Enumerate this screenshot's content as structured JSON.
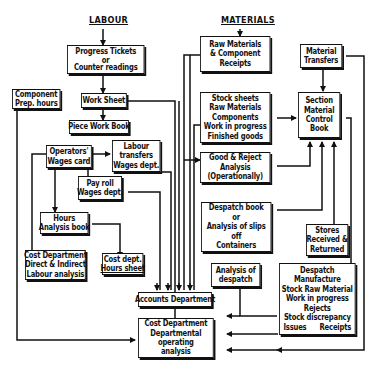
{
  "headings": {
    "labour": "LABOUR",
    "materials": "MATERIALS"
  },
  "boxes": {
    "progress_tickets": [
      "Progress Tickets",
      "or",
      "Counter readings"
    ],
    "component_prep": [
      "Component",
      "Prep. hours"
    ],
    "work_sheet": [
      "Work Sheet"
    ],
    "piece_work_book": [
      "Piece Work Book"
    ],
    "operators_wages": [
      "Operators'",
      "Wages card"
    ],
    "labour_transfers": [
      "Labour",
      "transfers",
      "Wages dept."
    ],
    "pay_roll": [
      "Pay roll",
      "Wages dept."
    ],
    "hours_analysis": [
      "Hours",
      "Analysis book"
    ],
    "cost_dept_labour": [
      "Cost Department",
      "Direct & Indirect",
      "Labour analysis"
    ],
    "cost_dept_hours": [
      "Cost dept.",
      "Hours sheet"
    ],
    "raw_materials": [
      "Raw Materials",
      "& Component",
      "Receipts"
    ],
    "material_transfers": [
      "Material",
      "Transfers"
    ],
    "stock_sheets": [
      "Stock sheets",
      "Raw Materials",
      "Components",
      "Work in progress",
      "Finished goods"
    ],
    "section_control": [
      "Section",
      "Material",
      "Control",
      "Book"
    ],
    "good_reject": [
      "Good & Reject",
      "Analysis",
      "(Operationally)"
    ],
    "despatch_book": [
      "Despatch book",
      "or",
      "Analysis of slips",
      "off",
      "Containers"
    ],
    "stores_received": [
      "Stores",
      "Received &",
      "Returned"
    ],
    "analysis_despatch": [
      "Analysis of",
      "despatch"
    ],
    "accounts_dept": [
      "Accounts Department"
    ],
    "despatch_manufacture": [
      "Despatch",
      "Manufacture",
      "Stock Raw Material",
      "Work in progress",
      "Rejects",
      "Stock discrepancy"
    ],
    "despatch_manufacture_last": {
      "left": "Issues",
      "right": "Receipts"
    },
    "cost_dept_operating": [
      "Cost Department",
      "Departmental",
      "operating",
      "analysis"
    ]
  }
}
